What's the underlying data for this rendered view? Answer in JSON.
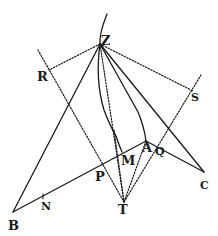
{
  "diagram": {
    "type": "geometric-figure",
    "colors": {
      "ink": "#1a1a1a",
      "background": "#ffffff"
    },
    "points": {
      "Z": {
        "x": 100,
        "y": 44,
        "label": "Z"
      },
      "R": {
        "x": 49,
        "y": 70,
        "label": "R"
      },
      "S": {
        "x": 193,
        "y": 91,
        "label": "S"
      },
      "A": {
        "x": 146,
        "y": 141,
        "label": "A"
      },
      "Q": {
        "x": 156,
        "y": 146,
        "label": "Q"
      },
      "M": {
        "x": 122,
        "y": 156,
        "label": "M"
      },
      "P": {
        "x": 101,
        "y": 166,
        "label": "P"
      },
      "C": {
        "x": 204,
        "y": 172,
        "label": "C"
      },
      "T": {
        "x": 124,
        "y": 202,
        "label": "T"
      },
      "N": {
        "x": 43,
        "y": 199,
        "label": "N"
      },
      "B": {
        "x": 13,
        "y": 212,
        "label": "B"
      }
    },
    "labels": [
      {
        "text": "Z",
        "x": 101,
        "y": 34
      },
      {
        "text": "R",
        "x": 37,
        "y": 70
      },
      {
        "text": "S",
        "x": 191,
        "y": 92
      },
      {
        "text": "A",
        "x": 142,
        "y": 141
      },
      {
        "text": "Q",
        "x": 155,
        "y": 146
      },
      {
        "text": "M",
        "x": 121,
        "y": 154
      },
      {
        "text": "P",
        "x": 95,
        "y": 170
      },
      {
        "text": "C",
        "x": 200,
        "y": 180
      },
      {
        "text": "T",
        "x": 118,
        "y": 203
      },
      {
        "text": "N",
        "x": 41,
        "y": 201
      },
      {
        "text": "B",
        "x": 8,
        "y": 219
      }
    ]
  }
}
